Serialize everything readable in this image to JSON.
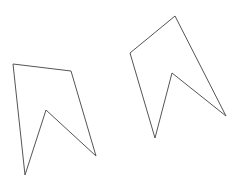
{
  "canvas": {
    "width": 244,
    "height": 191,
    "background": "#ffffff"
  },
  "shapes": [
    {
      "name": "left-arrow-polygon",
      "stroke": "#555555",
      "stroke_width": 1,
      "points": [
        [
          13,
          64
        ],
        [
          71,
          71
        ],
        [
          96,
          156
        ],
        [
          46,
          110
        ],
        [
          25,
          175
        ]
      ]
    },
    {
      "name": "right-arrow-polygon",
      "stroke": "#555555",
      "stroke_width": 1,
      "points": [
        [
          175,
          16
        ],
        [
          130,
          53
        ],
        [
          155,
          138
        ],
        [
          172,
          73
        ],
        [
          226,
          116
        ]
      ]
    }
  ]
}
